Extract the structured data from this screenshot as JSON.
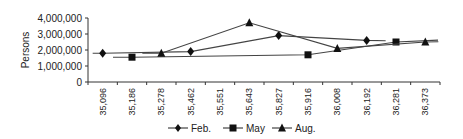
{
  "chart_data": {
    "type": "line",
    "title": "",
    "xlabel": "",
    "ylabel": "Persons",
    "ylim": [
      0,
      4000000
    ],
    "yticks": [
      "0",
      "1,000,000",
      "2,000,000",
      "3,000,000",
      "4,000,000"
    ],
    "categories": [
      "35,096",
      "35,186",
      "35,278",
      "35,462",
      "35,551",
      "35,643",
      "35,827",
      "35,916",
      "36,008",
      "36,192",
      "36,281",
      "36,373"
    ],
    "grid": false,
    "legend_position": "bottom",
    "series": [
      {
        "name": "Feb.",
        "marker": "diamond",
        "points": [
          {
            "x": "35,096",
            "y": 1800000
          },
          {
            "x": "35,462",
            "y": 1900000
          },
          {
            "x": "35,827",
            "y": 2900000
          },
          {
            "x": "36,192",
            "y": 2600000
          }
        ]
      },
      {
        "name": "May",
        "marker": "square",
        "points": [
          {
            "x": "35,186",
            "y": 1550000
          },
          {
            "x": "35,916",
            "y": 1700000
          },
          {
            "x": "36,281",
            "y": 2500000
          }
        ]
      },
      {
        "name": "Aug.",
        "marker": "triangle",
        "points": [
          {
            "x": "35,278",
            "y": 1800000
          },
          {
            "x": "35,643",
            "y": 3700000
          },
          {
            "x": "36,008",
            "y": 2100000
          },
          {
            "x": "36,373",
            "y": 2500000
          }
        ]
      }
    ]
  },
  "legend": {
    "items": [
      {
        "label": "Feb.",
        "marker": "diamond-icon"
      },
      {
        "label": "May",
        "marker": "square-icon"
      },
      {
        "label": "Aug.",
        "marker": "triangle-icon"
      }
    ]
  },
  "colors": {
    "line": "#444444",
    "marker": "#111111",
    "axis": "#333333"
  }
}
